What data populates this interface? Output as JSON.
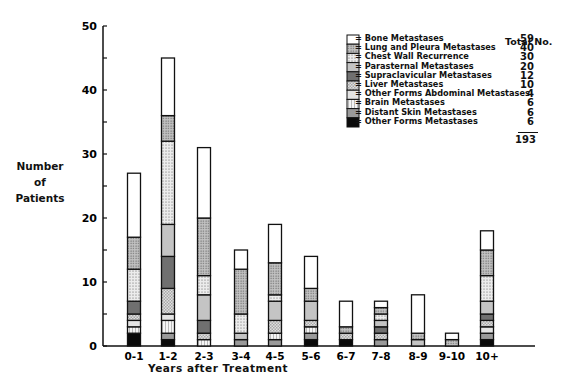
{
  "chart_data": {
    "type": "bar",
    "stacked": true,
    "title": "",
    "xlabel": "Years after Treatment",
    "ylabel": "Number of Patients",
    "ylim": [
      0,
      50
    ],
    "yticks": [
      0,
      10,
      20,
      30,
      40,
      50
    ],
    "grid": false,
    "legend_position": "upper right",
    "categories": [
      "0-1",
      "1-2",
      "2-3",
      "3-4",
      "4-5",
      "5-6",
      "6-7",
      "7-8",
      "8-9",
      "9-10",
      "10+"
    ],
    "totals": [
      27,
      45,
      31,
      15,
      19,
      14,
      7,
      7,
      8,
      2,
      18
    ],
    "series": [
      {
        "name": "Other Forms Metastases",
        "total": 6,
        "fill": "#0a0a0a",
        "pattern": "solid",
        "values": [
          2,
          1,
          0,
          0,
          0,
          1,
          1,
          0,
          0,
          0,
          1
        ]
      },
      {
        "name": "Distant Skin Metastases",
        "total": 6,
        "fill": "#9a9a9a",
        "pattern": "solid",
        "values": [
          0,
          1,
          0,
          1,
          1,
          1,
          0,
          1,
          0,
          0,
          1
        ]
      },
      {
        "name": "Brain Metastases",
        "total": 6,
        "fill": "#f0f0f0",
        "pattern": "vlines",
        "values": [
          1,
          2,
          1,
          0,
          1,
          1,
          0,
          0,
          0,
          0,
          0
        ]
      },
      {
        "name": "Other Forms Abdominal Metastases",
        "total": 4,
        "fill": "#e4e4e4",
        "pattern": "solid",
        "values": [
          1,
          1,
          0,
          0,
          0,
          0,
          0,
          0,
          0,
          0,
          1
        ]
      },
      {
        "name": "Liver Metastases",
        "total": 10,
        "fill": "#d8d8d8",
        "pattern": "check",
        "values": [
          1,
          4,
          1,
          0,
          2,
          1,
          1,
          1,
          0,
          0,
          1
        ]
      },
      {
        "name": "Supraclavicular Metastases",
        "total": 12,
        "fill": "#707070",
        "pattern": "solid",
        "values": [
          2,
          5,
          2,
          0,
          0,
          0,
          0,
          1,
          0,
          0,
          1
        ]
      },
      {
        "name": "Parasternal Metastases",
        "total": 20,
        "fill": "#c4c4c4",
        "pattern": "solid",
        "values": [
          0,
          5,
          4,
          1,
          3,
          3,
          0,
          1,
          1,
          0,
          2
        ]
      },
      {
        "name": "Chest Wall Recurrence",
        "total": 30,
        "fill": "#e2e2e2",
        "pattern": "dots-light",
        "values": [
          5,
          13,
          3,
          3,
          1,
          0,
          0,
          1,
          0,
          0,
          4
        ]
      },
      {
        "name": "Lung and Pleura Metastases",
        "total": 40,
        "fill": "#bdbdbd",
        "pattern": "dots-dark",
        "values": [
          5,
          4,
          9,
          7,
          5,
          2,
          1,
          1,
          1,
          1,
          4
        ]
      },
      {
        "name": "Bone Metastases",
        "total": 59,
        "fill": "#ffffff",
        "pattern": "solid",
        "values": [
          10,
          9,
          11,
          3,
          6,
          5,
          4,
          1,
          6,
          1,
          3
        ]
      }
    ],
    "legend_order": [
      "Bone Metastases",
      "Lung and Pleura Metastases",
      "Chest Wall Recurrence",
      "Parasternal Metastases",
      "Supraclavicular Metastases",
      "Liver Metastases",
      "Other Forms Abdominal Metastases",
      "Brain Metastases",
      "Distant Skin Metastases",
      "Other Forms Metastases"
    ],
    "grand_total": 193
  },
  "labels": {
    "ylabel_lines": [
      "Number",
      "of",
      "Patients"
    ],
    "xlabel": "Years after Treatment",
    "total_header": "Total No.",
    "legend_prefix": "=",
    "grand_total": "193"
  }
}
